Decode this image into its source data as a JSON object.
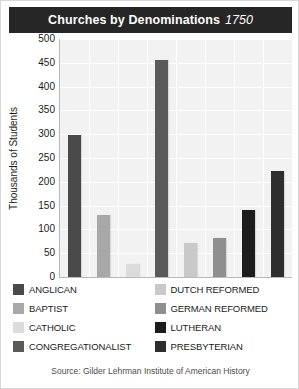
{
  "title": {
    "main": "Churches by Denominations",
    "year": "1750"
  },
  "source": {
    "text": "Source: Gilder Lehrman Institute of American History"
  },
  "chart_data": {
    "type": "bar",
    "title": "Churches by Denominations 1750",
    "xlabel": "",
    "ylabel": "Thousands of Students",
    "ylim": [
      0,
      500
    ],
    "ytick_labels": [
      "500",
      "450",
      "400",
      "350",
      "300",
      "250",
      "200",
      "150",
      "100",
      "50",
      "0"
    ],
    "ytick_values": [
      500,
      450,
      400,
      350,
      300,
      250,
      200,
      150,
      100,
      50,
      0
    ],
    "grid": true,
    "legend_position": "bottom",
    "categories": [
      "ANGLICAN",
      "BAPTIST",
      "CATHOLIC",
      "CONGREGATIONALIST",
      "DUTCH REFORMED",
      "GERMAN REFORMED",
      "LUTHERAN",
      "PRESBYTERIAN"
    ],
    "values": [
      298,
      130,
      27,
      455,
      72,
      82,
      140,
      222
    ],
    "colors": [
      "#4a4a4a",
      "#a8a8a8",
      "#dcdcdc",
      "#5a5a5a",
      "#c9c9c9",
      "#8f8f8f",
      "#1c1c1c",
      "#2e2e2e"
    ]
  },
  "legend": {
    "left": [
      {
        "label": "ANGLICAN",
        "color": "#4a4a4a"
      },
      {
        "label": "BAPTIST",
        "color": "#a8a8a8"
      },
      {
        "label": "CATHOLIC",
        "color": "#dcdcdc"
      },
      {
        "label": "CONGREGATIONALIST",
        "color": "#5a5a5a"
      }
    ],
    "right": [
      {
        "label": "DUTCH REFORMED",
        "color": "#c9c9c9"
      },
      {
        "label": "GERMAN REFORMED",
        "color": "#8f8f8f"
      },
      {
        "label": "LUTHERAN",
        "color": "#1c1c1c"
      },
      {
        "label": "PRESBYTERIAN",
        "color": "#2e2e2e"
      }
    ]
  }
}
